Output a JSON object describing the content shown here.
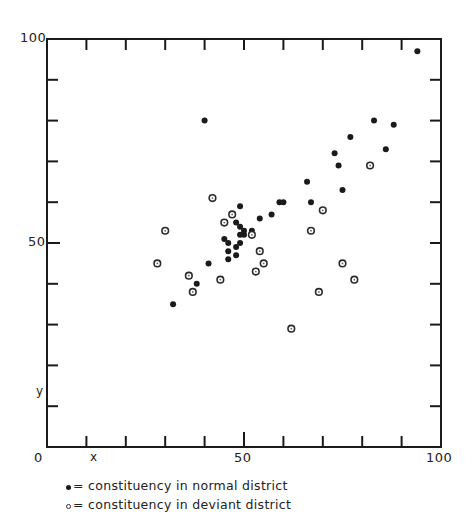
{
  "chart_data": {
    "type": "scatter",
    "title": "",
    "xlabel": "x",
    "ylabel": "y",
    "xlim": [
      0,
      100
    ],
    "ylim": [
      0,
      100
    ],
    "x_tick_labels": [
      "0",
      "50",
      "100"
    ],
    "y_tick_labels": [
      "0",
      "50",
      "100"
    ],
    "x_minor_ticks": [
      10,
      20,
      30,
      40,
      50,
      60,
      70,
      80,
      90
    ],
    "y_minor_ticks": [
      10,
      20,
      30,
      40,
      50,
      60,
      70,
      80,
      90
    ],
    "grid": false,
    "legend_position": "bottom-left, below plot",
    "series": [
      {
        "name": "constituency in normal district",
        "marker": "filled-dot",
        "points": [
          [
            94,
            97
          ],
          [
            83,
            80
          ],
          [
            88,
            79
          ],
          [
            77,
            76
          ],
          [
            86,
            73
          ],
          [
            73,
            72
          ],
          [
            74,
            69
          ],
          [
            66,
            65
          ],
          [
            75,
            63
          ],
          [
            59,
            60
          ],
          [
            60,
            60
          ],
          [
            67,
            60
          ],
          [
            49,
            59
          ],
          [
            57,
            57
          ],
          [
            54,
            56
          ],
          [
            48,
            55
          ],
          [
            49,
            54
          ],
          [
            52,
            53
          ],
          [
            50,
            53
          ],
          [
            49,
            52
          ],
          [
            50,
            52
          ],
          [
            45,
            51
          ],
          [
            49,
            50
          ],
          [
            46,
            50
          ],
          [
            48,
            49
          ],
          [
            46,
            48
          ],
          [
            48,
            47
          ],
          [
            46,
            46
          ],
          [
            41,
            45
          ],
          [
            38,
            40
          ],
          [
            32,
            35
          ],
          [
            40,
            80
          ]
        ]
      },
      {
        "name": "constituency in deviant district",
        "marker": "ringed-dot",
        "points": [
          [
            82,
            69
          ],
          [
            70,
            58
          ],
          [
            67,
            53
          ],
          [
            42,
            61
          ],
          [
            47,
            57
          ],
          [
            45,
            55
          ],
          [
            52,
            52
          ],
          [
            30,
            53
          ],
          [
            28,
            45
          ],
          [
            54,
            48
          ],
          [
            55,
            45
          ],
          [
            53,
            43
          ],
          [
            36,
            42
          ],
          [
            44,
            41
          ],
          [
            37,
            38
          ],
          [
            62,
            29
          ],
          [
            75,
            45
          ],
          [
            78,
            41
          ],
          [
            69,
            38
          ]
        ]
      }
    ]
  },
  "axes": {
    "origin_label": "0",
    "x_mid_label": "50",
    "x_max_label": "100",
    "y_mid_label": "50",
    "y_max_label": "100",
    "x_letter": "x",
    "y_letter": "y"
  },
  "legend": {
    "normal": "= constituency  in normal district",
    "deviant": "= constituency  in deviant district"
  },
  "colors": {
    "ink": "#1a1a1a",
    "background": "#ffffff"
  }
}
